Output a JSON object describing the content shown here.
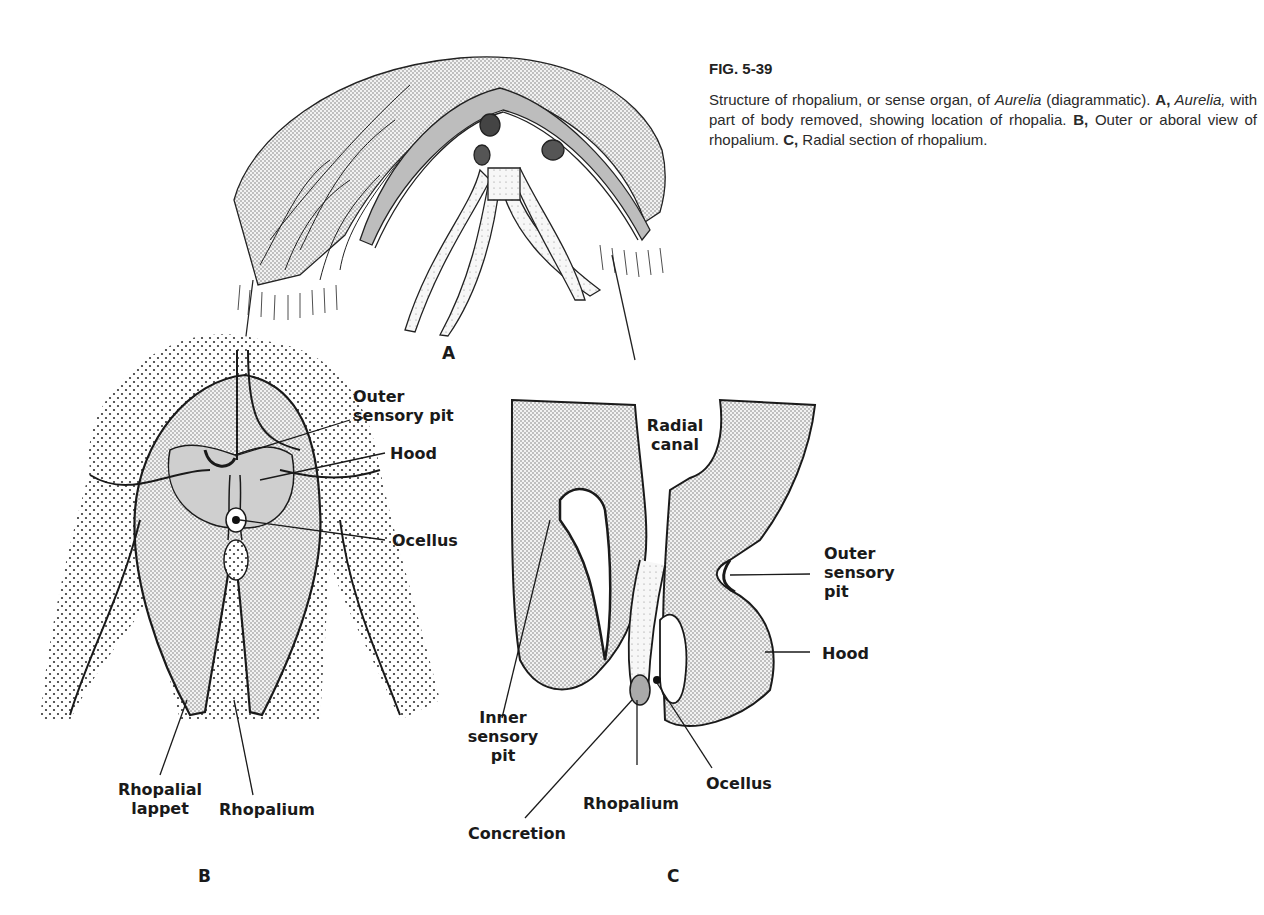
{
  "caption": {
    "figure_number": "FIG. 5-39",
    "text_1": "Structure of rhopalium, or sense organ, of ",
    "text_2_italic": "Aurelia",
    "text_3": " (diagrammatic). ",
    "a_label": "A,",
    "a_italic": " Aurelia,",
    "a_text": " with part of body removed, showing location of rhopalia. ",
    "b_label": "B,",
    "b_text": " Outer or aboral view of rhopalium. ",
    "c_label": "C,",
    "c_text": " Radial section of rhopalium."
  },
  "panels": {
    "a": {
      "letter": "A"
    },
    "b": {
      "letter": "B",
      "labels": {
        "outer_sensory_pit_1": "Outer",
        "outer_sensory_pit_2": "sensory pit",
        "hood": "Hood",
        "ocellus": "Ocellus",
        "rhopalial_lappet_1": "Rhopalial",
        "rhopalial_lappet_2": "lappet",
        "rhopalium": "Rhopalium"
      }
    },
    "c": {
      "letter": "C",
      "labels": {
        "radial_canal_1": "Radial",
        "radial_canal_2": "canal",
        "outer_sensory_pit_1": "Outer",
        "outer_sensory_pit_2": "sensory",
        "outer_sensory_pit_3": "pit",
        "hood": "Hood",
        "inner_sensory_pit_1": "Inner",
        "inner_sensory_pit_2": "sensory",
        "inner_sensory_pit_3": "pit",
        "ocellus": "Ocellus",
        "rhopalium": "Rhopalium",
        "concretion": "Concretion"
      }
    }
  },
  "colors": {
    "ink": "#1a1a1a",
    "stipple": "#e6e6e6",
    "dark_fill": "#b8b8b8",
    "background": "#ffffff"
  }
}
